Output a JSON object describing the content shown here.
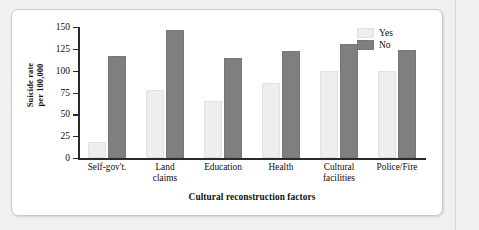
{
  "chart_data": {
    "type": "bar",
    "title": "",
    "xlabel": "Cultural reconstruction factors",
    "ylabel": "Suicide rate per 100,000",
    "ylabel_line1": "Suicide rate",
    "ylabel_line2": "per 100,000",
    "categories": [
      "Self-gov't.",
      "Land claims",
      "Education",
      "Health",
      "Cultural facilities",
      "Police/Fire"
    ],
    "category_lines": [
      [
        "Self-gov't."
      ],
      [
        "Land",
        "claims"
      ],
      [
        "Education"
      ],
      [
        "Health"
      ],
      [
        "Cultural",
        "facilities"
      ],
      [
        "Police/Fire"
      ]
    ],
    "series": [
      {
        "name": "Yes",
        "color": "#eeeeee",
        "values": [
          18,
          78,
          65,
          86,
          100,
          100
        ]
      },
      {
        "name": "No",
        "color": "#7f7f7f",
        "values": [
          117,
          147,
          114,
          123,
          130,
          124
        ]
      }
    ],
    "ylim": [
      0,
      150
    ],
    "yticks": [
      0,
      25,
      50,
      75,
      100,
      125,
      150
    ],
    "ytick_labels": [
      "0",
      "25",
      "50",
      "75",
      "100",
      "125",
      "150"
    ],
    "grid": false,
    "legend_position": "top-right"
  },
  "legend": {
    "entries": [
      {
        "label": "Yes"
      },
      {
        "label": "No"
      }
    ]
  },
  "colors": {
    "bar_yes": "#eeeeee",
    "bar_no": "#7f7f7f",
    "axis": "#2a2a2a",
    "panel_background": "#ffffff",
    "page_background": "#f0f0f0"
  }
}
